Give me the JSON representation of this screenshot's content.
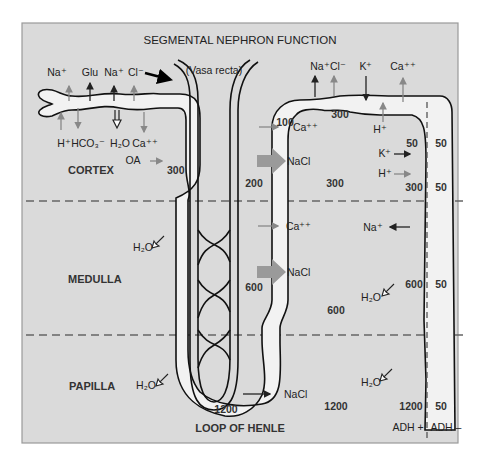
{
  "title": "SEGMENTAL NEPHRON FUNCTION",
  "regions": {
    "cortex": "CORTEX",
    "medulla": "MEDULLA",
    "papilla": "PAPILLA"
  },
  "loop_label": "LOOP OF HENLE",
  "vasa_recta_label": "(Vasa recta)",
  "proximal_tubule": {
    "reabsorbed": [
      "Na⁺",
      "Glu",
      "Na⁺",
      "Cl⁻"
    ],
    "secreted_or_exchanged": [
      "H⁺",
      "HCO₃⁻",
      "H₂O",
      "Ca⁺⁺"
    ],
    "oa_label": "OA",
    "osmolality": "300"
  },
  "descending_limb": {
    "water_out_medulla": "H₂O",
    "water_out_papilla": "H₂O",
    "tip_osmolality": "1200"
  },
  "ascending_limb": {
    "osmolality_cortex": "200",
    "osmolality_medulla": "600",
    "nacl_thick_cortex": "NaCl",
    "nacl_thick_medulla": "NaCl",
    "nacl_thin": "NaCl",
    "ca_cortex": "Ca⁺⁺",
    "ca_medulla": "Ca⁺⁺",
    "top_osmolality": "100"
  },
  "distal_tubule": {
    "reabsorbed": [
      "Na⁺",
      "Cl⁻",
      "Ca⁺⁺"
    ],
    "secreted": [
      "K⁺"
    ],
    "h_label": "H⁺",
    "osmolality": "300"
  },
  "interstitium": {
    "cortex": "300",
    "medulla": "600",
    "papilla": "1200"
  },
  "collecting_duct": {
    "k_secreted": "K⁺",
    "h_secreted": "H⁺",
    "na_reabsorbed": "Na⁺",
    "water_medulla": "H₂O",
    "water_papilla": "H₂O",
    "adh_plus": {
      "label": "ADH +",
      "values": [
        "50",
        "300",
        "600",
        "1200"
      ]
    },
    "adh_minus": {
      "label": "ADH –",
      "values": [
        "50",
        "50",
        "50",
        "50"
      ]
    }
  },
  "colors": {
    "background": "#dadada",
    "tubule_fill": "#f2f2f2",
    "outline": "#111111",
    "grey_arrow": "#888888",
    "nacl_arrow": "#999999"
  }
}
